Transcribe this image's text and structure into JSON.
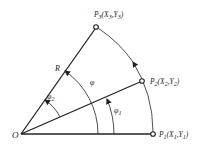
{
  "diagram": {
    "type": "geometry-arc-interpolation",
    "origin": {
      "label": "O",
      "x": 21,
      "y": 134
    },
    "points": [
      {
        "id": "P1",
        "name": "P",
        "sub": "1",
        "coords": "(X₁,Y₁)",
        "x": 153,
        "y": 134
      },
      {
        "id": "P2",
        "name": "P",
        "sub": "2",
        "coords": "(X₂,Y₂)",
        "x": 142,
        "y": 81
      },
      {
        "id": "P3",
        "name": "P",
        "sub": "3",
        "coords": "(X₃,Y₃)",
        "x": 96,
        "y": 27
      }
    ],
    "labels": {
      "origin": "O",
      "radius": "R",
      "phi": "φ",
      "phi1": "φ",
      "phi1_sub": "1",
      "phi2": "φ",
      "phi2_sub": "2",
      "p1_name": "P",
      "p1_sub": "1",
      "p1_coords_open": "(X",
      "p1_coords_sub1": "1",
      "p1_coords_mid": ",Y",
      "p1_coords_sub2": "1",
      "p1_coords_close": ")",
      "p2_name": "P",
      "p2_sub": "2",
      "p2_coords_open": "(X",
      "p2_coords_sub1": "2",
      "p2_coords_mid": ",Y",
      "p2_coords_sub2": "2",
      "p2_coords_close": ")",
      "p3_name": "P",
      "p3_sub": "3",
      "p3_coords_open": "(X",
      "p3_coords_sub1": "3",
      "p3_coords_mid": ",Y",
      "p3_coords_sub2": "3",
      "p3_coords_close": ")"
    },
    "colors": {
      "stroke": "#222222",
      "background": "#ffffff"
    }
  }
}
